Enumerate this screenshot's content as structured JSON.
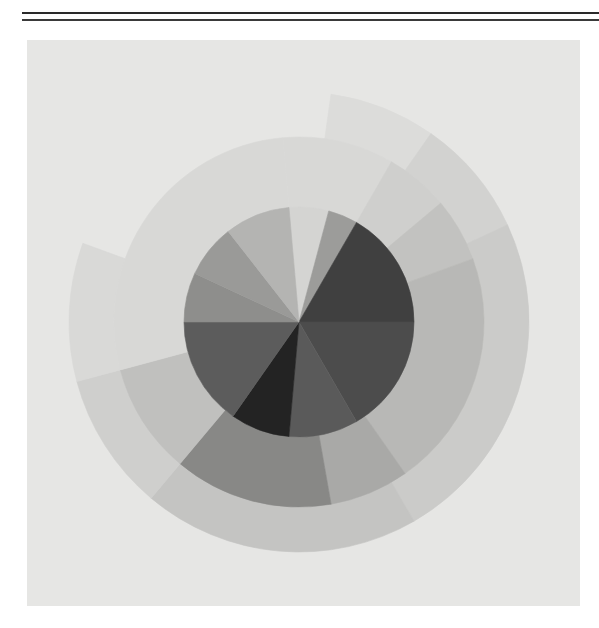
{
  "artwork": {
    "description": "Scanned abstract concentric circle with grayscale radial segments",
    "panel_color": "#e6e6e4",
    "center": [
      299,
      322
    ],
    "rings": [
      {
        "name": "inner-disk",
        "r_inner": 0,
        "r_outer": 115,
        "segments": [
          {
            "from": -95,
            "to": -75,
            "color": "#d4d4d2"
          },
          {
            "from": -75,
            "to": -60,
            "color": "#9c9c9a"
          },
          {
            "from": -60,
            "to": 0,
            "color": "#404040"
          },
          {
            "from": 0,
            "to": 60,
            "color": "#4c4c4c"
          },
          {
            "from": 60,
            "to": 95,
            "color": "#5a5a5a"
          },
          {
            "from": 95,
            "to": 125,
            "color": "#232323"
          },
          {
            "from": 125,
            "to": 180,
            "color": "#5c5c5c"
          },
          {
            "from": 180,
            "to": 205,
            "color": "#8e8e8c"
          },
          {
            "from": 205,
            "to": 232,
            "color": "#9a9a98"
          },
          {
            "from": 232,
            "to": 265,
            "color": "#b4b4b2"
          }
        ]
      },
      {
        "name": "middle-ring",
        "r_inner": 115,
        "r_outer": 185,
        "segments": [
          {
            "from": -95,
            "to": -60,
            "color": "#d8d8d6"
          },
          {
            "from": -60,
            "to": -40,
            "color": "#cfcfcd"
          },
          {
            "from": -40,
            "to": -20,
            "color": "#c2c2c0"
          },
          {
            "from": -20,
            "to": 55,
            "color": "#b8b8b6"
          },
          {
            "from": 55,
            "to": 80,
            "color": "#a9a9a7"
          },
          {
            "from": 80,
            "to": 130,
            "color": "#888886"
          },
          {
            "from": 130,
            "to": 165,
            "color": "#c0c0be"
          },
          {
            "from": 165,
            "to": 265,
            "color": "#d8d8d6"
          }
        ]
      },
      {
        "name": "outer-ring",
        "r_inner": 185,
        "r_outer": 230,
        "segments": [
          {
            "from": -82,
            "to": -55,
            "color": "#dcdcda"
          },
          {
            "from": -55,
            "to": -25,
            "color": "#d2d2d0"
          },
          {
            "from": -25,
            "to": 60,
            "color": "#cbcbc9"
          },
          {
            "from": 60,
            "to": 130,
            "color": "#c4c4c2"
          },
          {
            "from": 130,
            "to": 165,
            "color": "#cfcfcd"
          },
          {
            "from": 165,
            "to": 200,
            "color": "#d9d9d7"
          }
        ]
      }
    ]
  }
}
